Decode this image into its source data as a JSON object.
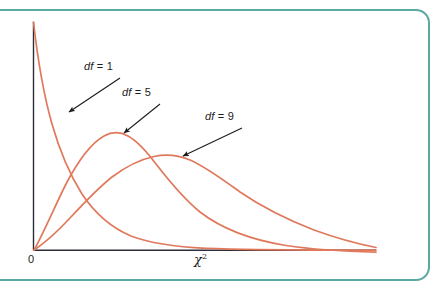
{
  "figure": {
    "border_color": "#5aa9a3",
    "background": "#ffffff",
    "axis_color": "#2d2d3a",
    "curve_color": "#e0795c",
    "annotation_color": "#1b1b1b"
  },
  "labels": {
    "df1_prefix": "df",
    "df1": "df = 1",
    "df5": "df = 9",
    "df9": "df = 9",
    "origin": "0",
    "xaxis_symbol": "χ",
    "xaxis_exponent": "2"
  },
  "chart_data": {
    "type": "line",
    "title": "",
    "subtitle": "",
    "xlabel": "χ²",
    "ylabel": "",
    "xlim": [
      0,
      26
    ],
    "ylim": [
      0,
      0.25
    ],
    "grid": false,
    "legend": "inline-annotations",
    "annotations": [
      {
        "text": "df = 1",
        "label_x": 84,
        "label_y": 60,
        "arrow_from_x": 120,
        "arrow_from_y": 78,
        "arrow_to_x": 68,
        "arrow_to_y": 113
      },
      {
        "text": "df = 5",
        "label_x": 122,
        "label_y": 86,
        "arrow_from_x": 160,
        "arrow_from_y": 104,
        "arrow_to_x": 123,
        "arrow_to_y": 134
      },
      {
        "text": "df = 9",
        "label_x": 205,
        "label_y": 110,
        "arrow_from_x": 242,
        "arrow_from_y": 128,
        "arrow_to_x": 182,
        "arrow_to_y": 157
      }
    ],
    "series": [
      {
        "name": "df = 1",
        "df": 1,
        "x": [
          0.05,
          0.2,
          0.4,
          0.7,
          1.0,
          1.5,
          2.0,
          2.6,
          3.2,
          4.0,
          5.0,
          6.2,
          7.5,
          9.0,
          11.0,
          13.0,
          15.5,
          18.0,
          21.0,
          24.0,
          26.0
        ],
        "y": [
          0.247,
          0.225,
          0.194,
          0.157,
          0.129,
          0.096,
          0.072,
          0.052,
          0.038,
          0.025,
          0.015,
          0.0085,
          0.0049,
          0.0028,
          0.0013,
          0.0007,
          0.0003,
          0.00015,
          7e-05,
          4e-05,
          3e-05
        ]
      },
      {
        "name": "df = 5",
        "df": 5,
        "x": [
          0.0,
          0.5,
          1.0,
          1.8,
          2.6,
          3.4,
          4.2,
          5.0,
          6.0,
          7.0,
          8.5,
          10.0,
          12.0,
          14.0,
          16.5,
          19.0,
          22.0,
          24.0,
          26.0
        ],
        "y": [
          0.0,
          0.035,
          0.08,
          0.13,
          0.154,
          0.158,
          0.151,
          0.139,
          0.12,
          0.1,
          0.073,
          0.052,
          0.031,
          0.018,
          0.0085,
          0.004,
          0.0016,
          0.0009,
          0.0005
        ]
      },
      {
        "name": "df = 9",
        "df": 9,
        "x": [
          0.0,
          1.0,
          2.0,
          3.2,
          4.5,
          5.8,
          7.0,
          8.0,
          9.0,
          10.5,
          12.0,
          14.0,
          16.0,
          18.5,
          21.0,
          23.5,
          26.0
        ],
        "y": [
          0.0,
          0.008,
          0.026,
          0.052,
          0.076,
          0.093,
          0.102,
          0.105,
          0.104,
          0.097,
          0.087,
          0.07,
          0.054,
          0.036,
          0.023,
          0.014,
          0.0085
        ]
      }
    ]
  }
}
